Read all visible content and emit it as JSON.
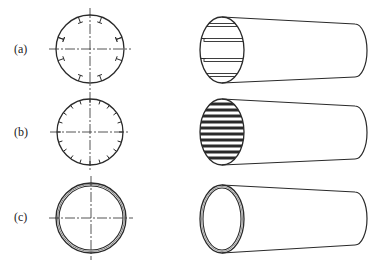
{
  "diagram": {
    "background": "#ffffff",
    "stroke_color": "#2a2a2a",
    "rows": [
      {
        "id": "a",
        "label": "(a)",
        "label_pos": {
          "x": 15,
          "y": 50
        },
        "section": {
          "cx": 90,
          "cy": 49,
          "r": 34,
          "marks": "hook-ticks",
          "mark_count": 10,
          "mark_angles": [
            -70,
            -110,
            -20,
            -160,
            20,
            160,
            70,
            110,
            200,
            340
          ]
        },
        "tube": {
          "ex": 222,
          "ey": 50,
          "rx": 22,
          "ry": 33,
          "far_x": 355,
          "far_top": 24,
          "far_bottom": 77,
          "far_rx": 12,
          "interior": "sparse-ribs",
          "rib_ys": [
            25,
            40,
            60,
            75
          ]
        }
      },
      {
        "id": "b",
        "label": "(b)",
        "label_pos": {
          "x": 15,
          "y": 133
        },
        "section": {
          "cx": 90,
          "cy": 132,
          "r": 33,
          "marks": "radial-ticks",
          "mark_count": 20
        },
        "tube": {
          "ex": 222,
          "ey": 132,
          "rx": 22,
          "ry": 33,
          "far_x": 355,
          "far_top": 106,
          "far_bottom": 159,
          "far_rx": 12,
          "interior": "dense-ribs",
          "rib_ys": [
            104,
            110,
            116,
            122,
            128,
            134,
            140,
            146,
            152,
            158
          ]
        }
      },
      {
        "id": "c",
        "label": "(c)",
        "label_pos": {
          "x": 15,
          "y": 218
        },
        "section": {
          "cx": 91,
          "cy": 218,
          "r": 35,
          "marks": "double-ring",
          "inner_r": 32
        },
        "tube": {
          "ex": 222,
          "ey": 219,
          "rx": 22,
          "ry": 34,
          "far_x": 355,
          "far_top": 192,
          "far_bottom": 245,
          "far_rx": 12,
          "interior": "double-ring",
          "inner_rx": 19,
          "inner_ry": 31
        }
      }
    ]
  }
}
